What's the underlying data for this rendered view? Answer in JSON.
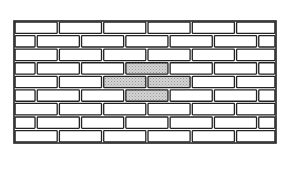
{
  "figure": {
    "type": "brick-wall-diagram",
    "frame": {
      "x": 14,
      "y": 21,
      "width": 262,
      "height": 122
    },
    "rows": 9,
    "brick_length": 44.3,
    "row_height": 13.55,
    "mortar_gap": 2.2,
    "colors": {
      "background": "#ffffff",
      "outline": "#222222",
      "brick_fill": "#ffffff",
      "highlight_fill": "#c8c8c8"
    },
    "highlighted_bricks": [
      {
        "row": 3,
        "index": 3
      },
      {
        "row": 4,
        "index": 2
      },
      {
        "row": 4,
        "index": 3
      },
      {
        "row": 5,
        "index": 3
      }
    ],
    "highlight_count": 4
  }
}
